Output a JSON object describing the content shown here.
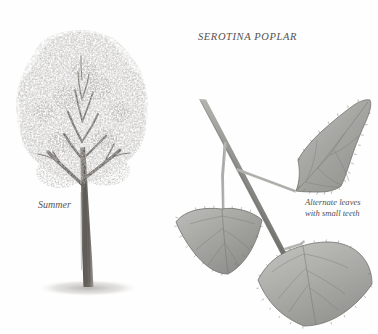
{
  "plate": {
    "title": "SEROTINA POPLAR",
    "season_label": "Summer",
    "leaf_caption_line1": "Alternate leaves",
    "leaf_caption_line2": "with small teeth",
    "background_color": "#fefefe",
    "ink_color": "#55514e",
    "foliage_color": "#a8a8a4",
    "trunk_color": "#6e6a66",
    "leaf_fill_color": "#a9aaa6",
    "leaf_edge_color": "#6f7170",
    "twig_color": "#8a8b87"
  },
  "subjects": {
    "habit": {
      "name": "full-tree-habit",
      "caption": "Summer"
    },
    "specimen": {
      "name": "leafy-twig-specimen",
      "leaf_count": 3,
      "leaves": [
        {
          "name": "leaf-upper-right",
          "shape": "deltoid",
          "margin": "small teeth"
        },
        {
          "name": "leaf-lower-left",
          "shape": "deltoid",
          "margin": "small teeth"
        },
        {
          "name": "leaf-lower-right",
          "shape": "deltoid",
          "margin": "small teeth"
        }
      ]
    }
  }
}
